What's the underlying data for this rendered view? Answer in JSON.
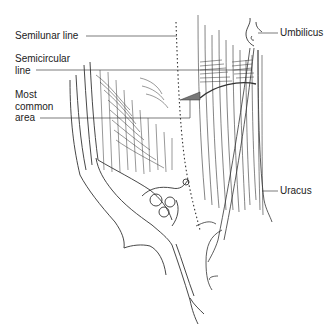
{
  "figure": {
    "labels": {
      "semilunar_line": "Semilunar line",
      "semicircular_line_1": "Semicircular",
      "semicircular_line_2": "line",
      "most_common_area_1": "Most",
      "most_common_area_2": "common",
      "most_common_area_3": "area",
      "umbilicus": "Umbilicus",
      "uracus": "Uracus"
    },
    "colors": {
      "ink": "#333333",
      "background": "#ffffff"
    }
  }
}
